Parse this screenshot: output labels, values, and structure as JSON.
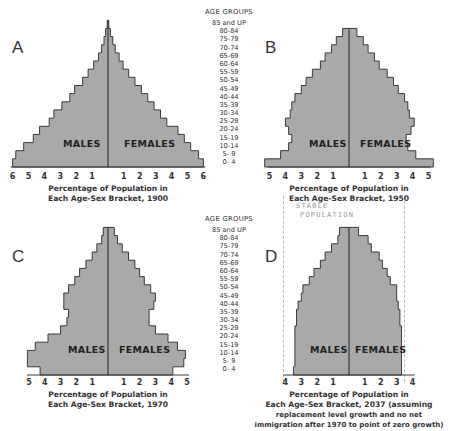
{
  "age_groups": {
    "header": "AGE GROUPS",
    "labels": [
      "85 and UP",
      "80-84",
      "75-79",
      "70-74",
      "65-69",
      "60-64",
      "55-59",
      "50-54",
      "45-49",
      "40-44",
      "35-39",
      "30-34",
      "25-29",
      "20-24",
      "15-19",
      "10-14",
      "5- 9",
      "0- 4"
    ]
  },
  "sex_labels": {
    "male": "MALES",
    "female": "FEMALES"
  },
  "colors": {
    "bar_fill": "#a9a9a9",
    "bar_stroke": "#3a3a3a",
    "axis": "#333333"
  },
  "panels": [
    {
      "letter": "A",
      "caption": [
        "Percentage of Population in",
        "Each Age-Sex Bracket, 1900"
      ]
    },
    {
      "letter": "B",
      "caption": [
        "Percentage of Population in",
        "Each Age-Sex Bracket, 1950"
      ]
    },
    {
      "letter": "C",
      "caption": [
        "Percentage of Population in",
        "Each Age-Sex Bracket, 1970"
      ]
    },
    {
      "letter": "D",
      "caption": [
        "Percentage of Population in",
        "Each Age-Sex Bracket, 2037 (assuming",
        "replacement level growth and no net",
        "immigration after 1970 to point of zero growth)"
      ],
      "annotation": [
        "STABLE",
        "POPULATION"
      ]
    }
  ],
  "chart_data": [
    {
      "type": "bar",
      "subtype": "population-pyramid",
      "panel": "A",
      "title": "A",
      "xlabel": "Percentage of Population in Each Age-Sex Bracket, 1900",
      "ylabel": "AGE GROUPS",
      "categories": [
        "0- 4",
        "5- 9",
        "10-14",
        "15-19",
        "20-24",
        "25-29",
        "30-34",
        "35-39",
        "40-44",
        "45-49",
        "50-54",
        "55-59",
        "60-64",
        "65-69",
        "70-74",
        "75-79",
        "80-84",
        "85 and UP"
      ],
      "xticks": [
        6,
        5,
        4,
        3,
        2,
        1,
        1,
        2,
        3,
        4,
        5,
        6
      ],
      "xlim": [
        -6,
        6
      ],
      "series": [
        {
          "name": "MALES",
          "values": [
            6.0,
            5.8,
            5.3,
            4.7,
            4.3,
            3.7,
            3.4,
            2.9,
            2.4,
            2.1,
            1.6,
            1.25,
            0.9,
            0.6,
            0.4,
            0.25,
            0.15,
            0.05
          ]
        },
        {
          "name": "FEMALES",
          "values": [
            6.0,
            5.7,
            5.2,
            4.8,
            4.4,
            3.7,
            3.3,
            2.9,
            2.5,
            2.1,
            1.7,
            1.3,
            0.95,
            0.7,
            0.45,
            0.3,
            0.15,
            0.05
          ]
        }
      ]
    },
    {
      "type": "bar",
      "subtype": "population-pyramid",
      "panel": "B",
      "title": "B",
      "xlabel": "Percentage of Population in Each Age-Sex Bracket, 1950",
      "ylabel": "AGE GROUPS",
      "categories": [
        "0- 4",
        "5- 9",
        "10-14",
        "15-19",
        "20-24",
        "25-29",
        "30-34",
        "35-39",
        "40-44",
        "45-49",
        "50-54",
        "55-59",
        "60-64",
        "65-69",
        "70-74",
        "75-79",
        "80-84",
        "85 and UP"
      ],
      "xticks": [
        5,
        4,
        3,
        2,
        1,
        1,
        2,
        3,
        4,
        5
      ],
      "xlim": [
        -5.5,
        5.5
      ],
      "series": [
        {
          "name": "MALES",
          "values": [
            5.3,
            4.3,
            3.8,
            3.6,
            3.8,
            4.0,
            3.7,
            3.6,
            3.4,
            3.0,
            2.7,
            2.3,
            1.8,
            1.5,
            1.1,
            0.8,
            0.4,
            0.0
          ]
        },
        {
          "name": "FEMALES",
          "values": [
            5.3,
            4.2,
            3.7,
            3.6,
            3.9,
            4.1,
            3.8,
            3.7,
            3.5,
            3.1,
            2.8,
            2.4,
            1.9,
            1.6,
            1.2,
            0.9,
            0.5,
            0.0
          ]
        }
      ]
    },
    {
      "type": "bar",
      "subtype": "population-pyramid",
      "panel": "C",
      "title": "C",
      "xlabel": "Percentage of Population in Each Age-Sex Bracket, 1970",
      "ylabel": "AGE GROUPS",
      "categories": [
        "0- 4",
        "5- 9",
        "10-14",
        "15-19",
        "20-24",
        "25-29",
        "30-34",
        "35-39",
        "40-44",
        "45-49",
        "50-54",
        "55-59",
        "60-64",
        "65-69",
        "70-74",
        "75-79",
        "80-84",
        "85 and UP"
      ],
      "xticks": [
        5,
        4,
        3,
        2,
        1,
        1,
        2,
        3,
        4,
        5
      ],
      "xlim": [
        -5,
        5
      ],
      "series": [
        {
          "name": "MALES",
          "values": [
            4.3,
            5.1,
            5.1,
            4.6,
            3.8,
            3.0,
            2.6,
            2.5,
            2.8,
            2.8,
            2.5,
            2.1,
            1.8,
            1.4,
            1.0,
            0.7,
            0.4,
            0.3
          ]
        },
        {
          "name": "FEMALES",
          "values": [
            4.1,
            4.8,
            4.9,
            4.4,
            3.8,
            3.0,
            2.6,
            2.6,
            2.9,
            3.0,
            2.7,
            2.3,
            2.0,
            1.7,
            1.3,
            0.9,
            0.6,
            0.4
          ]
        }
      ]
    },
    {
      "type": "bar",
      "subtype": "population-pyramid",
      "panel": "D",
      "title": "D",
      "xlabel": "Percentage of Population in Each Age-Sex Bracket, 2037 (assuming replacement level growth and no net immigration after 1970 to point of zero growth)",
      "ylabel": "AGE GROUPS",
      "annotation": "STABLE POPULATION",
      "categories": [
        "0- 4",
        "5- 9",
        "10-14",
        "15-19",
        "20-24",
        "25-29",
        "30-34",
        "35-39",
        "40-44",
        "45-49",
        "50-54",
        "55-59",
        "60-64",
        "65-69",
        "70-74",
        "75-79",
        "80-84",
        "85 and UP"
      ],
      "xticks": [
        4,
        3,
        2,
        1,
        1,
        2,
        3,
        4
      ],
      "xlim": [
        -4,
        4
      ],
      "series": [
        {
          "name": "MALES",
          "values": [
            3.5,
            3.4,
            3.4,
            3.4,
            3.4,
            3.4,
            3.3,
            3.3,
            3.2,
            3.0,
            2.9,
            2.5,
            2.2,
            1.8,
            1.5,
            1.1,
            0.7,
            0.6
          ]
        },
        {
          "name": "FEMALES",
          "values": [
            3.3,
            3.3,
            3.3,
            3.3,
            3.3,
            3.3,
            3.2,
            3.2,
            3.1,
            3.0,
            3.0,
            2.6,
            2.4,
            2.1,
            1.9,
            1.4,
            1.2,
            0.6
          ]
        }
      ]
    }
  ]
}
